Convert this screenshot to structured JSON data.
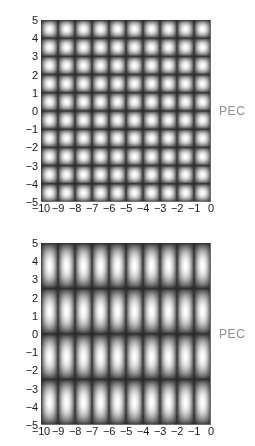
{
  "figure": {
    "background_color": "#ffffff",
    "axis_text_color": "#1a1a1a",
    "annotation_color": "#8f8f8f",
    "boundary_label": "PEC"
  },
  "panels": [
    {
      "id": "top",
      "annotation": "PEC",
      "x_ticks": [
        "−10",
        "−9",
        "−8",
        "−7",
        "−6",
        "−5",
        "−4",
        "−3",
        "−2",
        "−1",
        "0"
      ],
      "y_ticks": [
        "5",
        "4",
        "3",
        "2",
        "1",
        "0",
        "−1",
        "−2",
        "−3",
        "−4",
        "−5"
      ]
    },
    {
      "id": "bottom",
      "annotation": "PEC",
      "x_ticks": [
        "−10",
        "−9",
        "−8",
        "−7",
        "−6",
        "−5",
        "−4",
        "−3",
        "−2",
        "−1",
        "0"
      ],
      "y_ticks": [
        "5",
        "4",
        "3",
        "2",
        "1",
        "0",
        "−1",
        "−2",
        "−3",
        "−4",
        "−5"
      ]
    }
  ],
  "chart_data": [
    {
      "type": "heatmap",
      "title": "",
      "xlabel": "",
      "ylabel": "",
      "xlim": [
        -10,
        0
      ],
      "ylim": [
        -5,
        5
      ],
      "grid": false,
      "colormap": "grayscale",
      "annotations": [
        {
          "text": "PEC",
          "position": "right-edge-center"
        }
      ],
      "xticklabels": [
        "−10",
        "−9",
        "−8",
        "−7",
        "−6",
        "−5",
        "−4",
        "−3",
        "−2",
        "−1",
        "0"
      ],
      "yticklabels": [
        "5",
        "4",
        "3",
        "2",
        "1",
        "0",
        "−1",
        "−2",
        "−3",
        "−4",
        "−5"
      ],
      "pattern": "checkerboard standing wave",
      "x_period": 1.0,
      "y_period": 1.0,
      "cells_x": 20,
      "cells_y": 20,
      "value_range": [
        0,
        1
      ]
    },
    {
      "type": "heatmap",
      "title": "",
      "xlabel": "",
      "ylabel": "",
      "xlim": [
        -10,
        0
      ],
      "ylim": [
        -5,
        5
      ],
      "grid": false,
      "colormap": "grayscale",
      "annotations": [
        {
          "text": "PEC",
          "position": "right-edge-center"
        }
      ],
      "xticklabels": [
        "−10",
        "−9",
        "−8",
        "−7",
        "−6",
        "−5",
        "−4",
        "−3",
        "−2",
        "−1",
        "0"
      ],
      "yticklabels": [
        "5",
        "4",
        "3",
        "2",
        "1",
        "0",
        "−1",
        "−2",
        "−3",
        "−4",
        "−5"
      ],
      "pattern": "vertical stripes banded in y",
      "x_period": 1.0,
      "y_period": 2.5,
      "stripes_x": 10,
      "bands_y": 4,
      "value_range": [
        0,
        1
      ]
    }
  ]
}
